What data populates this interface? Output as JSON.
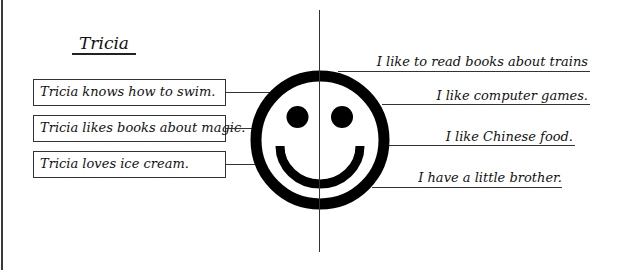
{
  "worksheet": {
    "title": "Tricia",
    "facts_about_tricia": [
      "Tricia knows how to swim.",
      "Tricia likes books about magic.",
      "Tricia loves ice cream."
    ],
    "my_facts": [
      "I like to read books about trains",
      "I like computer games.",
      "I like Chinese food.",
      "I have a little brother."
    ],
    "center_icon": "smiley-face-icon",
    "colors": {
      "ink": "#111111",
      "background": "#ffffff"
    }
  }
}
